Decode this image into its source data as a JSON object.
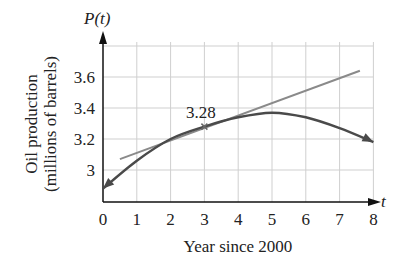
{
  "chart_data": {
    "type": "line",
    "title": "",
    "xlabel": "Year since 2000",
    "ylabel": "Oil production (millions of barrels)",
    "x_axis_symbol": "t",
    "y_axis_symbol": "P(t)",
    "xlim": [
      0,
      8
    ],
    "ylim": [
      2.8,
      3.8
    ],
    "x_ticks": [
      "0",
      "1",
      "2",
      "3",
      "4",
      "5",
      "6",
      "7",
      "8"
    ],
    "y_ticks": [
      "3",
      "3.2",
      "3.4",
      "3.6"
    ],
    "grid": true,
    "series": [
      {
        "name": "P(t)",
        "style": "curve",
        "color": "#4a4a4a",
        "x": [
          0,
          1,
          2,
          3,
          4,
          5,
          6,
          7,
          8
        ],
        "values": [
          2.88,
          3.06,
          3.2,
          3.28,
          3.34,
          3.37,
          3.34,
          3.27,
          3.18
        ]
      },
      {
        "name": "tangent line at t=3",
        "style": "line",
        "color": "#8a8a8a",
        "x": [
          0.5,
          7.6
        ],
        "values": [
          3.07,
          3.64
        ]
      }
    ],
    "annotations": [
      {
        "text": "3.28",
        "x": 3,
        "y": 3.28,
        "marker": "x"
      }
    ]
  },
  "labels": {
    "y_symbol": "P(t)",
    "x_symbol": "t",
    "xlabel": "Year since 2000",
    "ylabel_line1": "Oil production",
    "ylabel_line2": "(millions of barrels)",
    "point_label": "3.28"
  }
}
